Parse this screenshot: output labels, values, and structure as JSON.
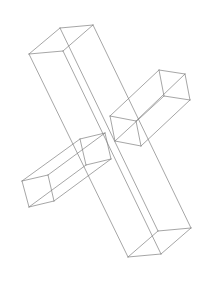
{
  "canvas": {
    "width": 208,
    "height": 284,
    "background_color": "#ffffff",
    "title": "Wireframe drawing of three crossing rectangular beams"
  },
  "style": {
    "stroke_color": "#808080",
    "stroke_width": 0.7,
    "fill": "none",
    "render_mode": "wireframe"
  },
  "scene": {
    "object_count": 3,
    "object_type": "rectangular-box-beam",
    "arrangement": "crossing-cross-shape"
  },
  "beams": [
    {
      "id": "beam-long-vertical",
      "name": "long-diagonal-beam",
      "description": "Longest beam running from upper-left to lower-right",
      "vertices": {
        "near_top_left": [
          29,
          54
        ],
        "near_top_right": [
          60,
          28
        ],
        "far_top_right": [
          93,
          25
        ],
        "far_top_left": [
          63,
          51
        ],
        "near_bottom_left": [
          128,
          257
        ],
        "near_bottom_right": [
          158,
          231
        ],
        "far_bottom_right": [
          191,
          228
        ],
        "far_bottom_left": [
          161,
          254
        ]
      }
    },
    {
      "id": "beam-upper-right",
      "name": "upper-right-beam",
      "description": "Beam extending to the upper right from the crossing region",
      "vertices": {
        "near_inner_top": [
          110,
          116
        ],
        "near_inner_bottom": [
          115,
          141
        ],
        "far_inner_bottom": [
          141,
          146
        ],
        "far_inner_top": [
          136,
          121
        ],
        "near_outer_top": [
          159,
          70
        ],
        "near_outer_bottom": [
          164,
          96
        ],
        "far_outer_bottom": [
          190,
          100
        ],
        "far_outer_top": [
          185,
          74
        ]
      }
    },
    {
      "id": "beam-lower-left",
      "name": "lower-left-beam",
      "description": "Beam extending to the lower left from the crossing region",
      "vertices": {
        "near_inner_top": [
          80,
          139
        ],
        "near_inner_bottom": [
          86,
          165
        ],
        "far_inner_bottom": [
          111,
          159
        ],
        "far_inner_top": [
          105,
          133
        ],
        "near_outer_top": [
          22,
          181
        ],
        "near_outer_bottom": [
          29,
          207
        ],
        "far_outer_bottom": [
          54,
          201
        ],
        "far_outer_top": [
          48,
          175
        ]
      }
    }
  ]
}
